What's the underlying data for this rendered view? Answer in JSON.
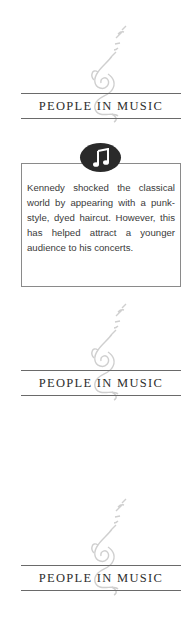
{
  "sections": [
    {
      "heading": "PEOPLE IN MUSIC",
      "emblem": "violinist-emblem-icon"
    },
    {
      "heading": "PEOPLE IN MUSIC",
      "emblem": "violinist-emblem-icon"
    },
    {
      "heading": "PEOPLE IN MUSIC",
      "emblem": "violinist-emblem-icon"
    }
  ],
  "fact_box": {
    "icon": "music-note-icon",
    "text": "Kennedy shocked the classical world by appearing with a punk-style, dyed haircut. However, this has helped attract a younger audience to his concerts."
  },
  "colors": {
    "rule": "#6a6a6a",
    "heading": "#2d2d2d",
    "emblem": "#cfcfcf",
    "icon_bg": "#2a2a2a",
    "body_text": "#3a3a3a"
  }
}
